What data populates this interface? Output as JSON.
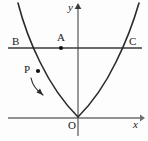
{
  "figure": {
    "background_color": "#fdfdfd",
    "stroke_color": "#2b2b2b",
    "axis_color": "#6e6e6e"
  },
  "axes": {
    "x_axis_label": "x",
    "y_axis_label": "y",
    "origin_label": "O",
    "x_axis": {
      "x1": 8,
      "y1": 118,
      "x2": 142,
      "y2": 118
    },
    "y_axis": {
      "x1": 78,
      "y1": 136,
      "x2": 78,
      "y2": 6
    },
    "x_label_pos": {
      "x": 133,
      "y": 119
    },
    "y_label_pos": {
      "x": 68,
      "y": 2
    },
    "origin_label_pos": {
      "x": 68,
      "y": 120
    }
  },
  "curve": {
    "name": "parabola",
    "vertex": {
      "x": 78,
      "y": 117
    },
    "path": "M 18 3 Q 26 34 40 62 Q 56 95 78 117 Q 100 95 116 62 Q 130 34 139 3",
    "opens": "upward"
  },
  "chord": {
    "name": "segment-BC",
    "x1": 8,
    "y1": 48,
    "x2": 142,
    "y2": 48
  },
  "points": [
    {
      "id": "B",
      "label": "B",
      "x": 30,
      "y": 48,
      "label_x": 12,
      "label_y": 36,
      "dot": false
    },
    {
      "id": "A",
      "label": "A",
      "x": 61,
      "y": 48,
      "label_x": 57,
      "label_y": 32,
      "dot": true
    },
    {
      "id": "C",
      "label": "C",
      "x": 126,
      "y": 48,
      "label_x": 129,
      "label_y": 36,
      "dot": false
    },
    {
      "id": "P",
      "label": "P",
      "x": 38,
      "y": 71,
      "label_x": 24,
      "label_y": 64,
      "dot": true
    }
  ],
  "motion_arrow": {
    "name": "p-motion-arrow",
    "description": "curved arrow indicating P moves down along the left branch",
    "path": "M 31 78 Q 33 88 43 95",
    "arrow_tip": {
      "x": 43,
      "y": 95
    }
  }
}
